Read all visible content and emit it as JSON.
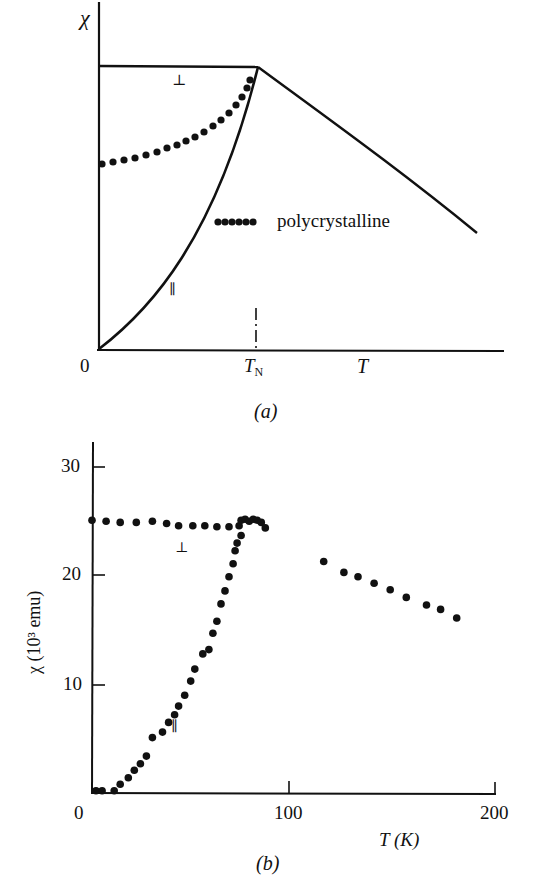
{
  "figure": {
    "panel_a": {
      "caption": "(a)",
      "y_axis_label": "χ",
      "x_axis_label": "T",
      "x_origin_label": "0",
      "tn_label": "T",
      "tn_sub": "N",
      "perp_label": "⊥",
      "par_label": "∥",
      "legend_label": "polycrystalline"
    },
    "panel_b": {
      "caption": "(b)",
      "y_axis_label": "χ (10³ emu)",
      "x_axis_label": "T (K)",
      "x_ticks": [
        "0",
        "100",
        "200"
      ],
      "y_ticks": [
        "10",
        "20",
        "30"
      ],
      "perp_label": "⊥",
      "par_label": "∥"
    }
  },
  "chart_data": [
    {
      "type": "line",
      "title": "(a)",
      "xlabel": "T",
      "ylabel": "χ",
      "x_ticks": [
        "0",
        "T_N"
      ],
      "grid": false,
      "units": "schematic (normalized; T_N = 1, χ(T_N) = 1)",
      "series": [
        {
          "name": "⊥",
          "style": "solid",
          "x": [
            0,
            1
          ],
          "y": [
            1.0,
            1.0
          ]
        },
        {
          "name": "∥",
          "style": "solid",
          "x": [
            0,
            0.2,
            0.4,
            0.6,
            0.8,
            1.0
          ],
          "y": [
            0,
            0.12,
            0.28,
            0.48,
            0.72,
            1.0
          ]
        },
        {
          "name": "paramagnetic (T > T_N)",
          "style": "solid",
          "x": [
            1.0,
            1.25,
            1.5,
            1.75,
            1.95
          ],
          "y": [
            1.0,
            0.86,
            0.72,
            0.6,
            0.4
          ]
        },
        {
          "name": "polycrystalline",
          "style": "dotted",
          "x": [
            0,
            0.2,
            0.4,
            0.6,
            0.8,
            0.95
          ],
          "y": [
            0.67,
            0.7,
            0.74,
            0.8,
            0.88,
            0.96
          ]
        }
      ],
      "annotations": [
        "T_N marked with dash-dot vertical tick",
        "legend: ●●●●● polycrystalline"
      ]
    },
    {
      "type": "scatter",
      "title": "(b)",
      "xlabel": "T (K)",
      "ylabel": "χ (10³ emu)",
      "xlim": [
        0,
        200
      ],
      "ylim": [
        0,
        32
      ],
      "x_ticks": [
        0,
        100,
        200
      ],
      "y_ticks": [
        10,
        20,
        30
      ],
      "grid": false,
      "series": [
        {
          "name": "⊥",
          "x": [
            0,
            7,
            14,
            22,
            30,
            37,
            43,
            50,
            56,
            62,
            68,
            73
          ],
          "y": [
            25.1,
            25.0,
            24.9,
            24.9,
            25.0,
            24.8,
            24.6,
            24.6,
            24.6,
            24.5,
            24.5,
            24.6
          ]
        },
        {
          "name": "∥",
          "x": [
            2,
            5,
            11,
            14,
            18,
            21,
            24,
            27,
            30,
            35,
            38,
            41,
            43,
            46,
            49,
            51,
            55,
            58,
            60,
            62,
            64,
            66,
            68,
            70,
            71,
            72,
            74
          ],
          "y": [
            0.2,
            0.2,
            0.2,
            0.8,
            1.4,
            2.1,
            2.7,
            3.4,
            5.1,
            5.6,
            6.5,
            7.2,
            8.0,
            9.0,
            10.3,
            11.4,
            12.8,
            13.2,
            14.7,
            15.8,
            17.4,
            18.6,
            19.9,
            21.1,
            22.3,
            23.0,
            23.7
          ]
        },
        {
          "name": "near T_N (merged)",
          "x": [
            74,
            76,
            78,
            80,
            82,
            84,
            86
          ],
          "y": [
            25.1,
            25.2,
            25.0,
            25.2,
            25.1,
            24.9,
            24.4
          ]
        },
        {
          "name": "paramagnetic",
          "x": [
            115,
            125,
            132,
            140,
            148,
            156,
            166,
            173,
            181
          ],
          "y": [
            21.3,
            20.3,
            19.9,
            19.3,
            18.7,
            18.0,
            17.3,
            16.9,
            16.1
          ]
        }
      ]
    }
  ]
}
